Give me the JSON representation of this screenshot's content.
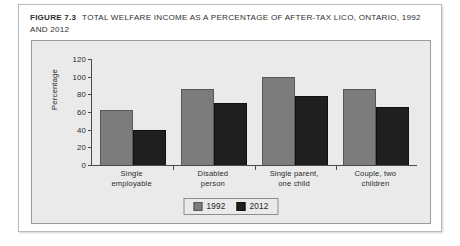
{
  "figure": {
    "number_label": "FIGURE 7.3",
    "caption": "TOTAL WELFARE INCOME AS A PERCENTAGE OF AFTER-TAX LICO, ONTARIO, 1992 AND 2012"
  },
  "colors": {
    "series_1992": "#7c7c7c",
    "series_2012": "#1f1f1f",
    "panel_background": "#eaeaea",
    "axis": "#4a4a4a",
    "card_background": "#ffffff"
  },
  "chart_data": {
    "type": "bar",
    "title": "TOTAL WELFARE INCOME AS A PERCENTAGE OF AFTER-TAX LICO, ONTARIO, 1992 AND 2012",
    "xlabel": "",
    "ylabel": "Percentage",
    "categories": [
      "Single employable",
      "Disabled person",
      "Single parent, one child",
      "Couple, two children"
    ],
    "category_lines": [
      [
        "Single",
        "employable"
      ],
      [
        "Disabled",
        "person"
      ],
      [
        "Single parent,",
        "one child"
      ],
      [
        "Couple, two",
        "children"
      ]
    ],
    "series": [
      {
        "name": "1992",
        "values": [
          62,
          86,
          100,
          86
        ]
      },
      {
        "name": "2012",
        "values": [
          40,
          70,
          78,
          66
        ]
      }
    ],
    "ylim": [
      0,
      120
    ],
    "yticks": [
      0,
      20,
      40,
      60,
      80,
      100,
      120
    ],
    "ytick_labels": [
      "0",
      "20",
      "40",
      "60",
      "80",
      "100",
      "120"
    ],
    "grid": false,
    "legend_position": "bottom-center",
    "legend_entries": [
      "1992",
      "2012"
    ]
  }
}
